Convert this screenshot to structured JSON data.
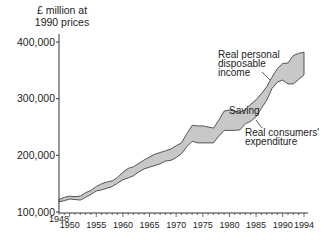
{
  "chart_data": {
    "type": "area",
    "title": "",
    "ylabel": "£ million at 1990 prices",
    "xlabel": "",
    "ylim": [
      100000,
      400000
    ],
    "yticks": [
      100000,
      200000,
      300000,
      400000
    ],
    "ytick_labels": [
      "100,000",
      "200,000",
      "300,000",
      "400,000"
    ],
    "xticks_labels": [
      "1948",
      "1950",
      "1955",
      "1960",
      "1965",
      "1970",
      "1975",
      "1980",
      "1985",
      "1990",
      "1994"
    ],
    "xlim": [
      1948,
      1994
    ],
    "grid": false,
    "x": [
      1948,
      1949,
      1950,
      1951,
      1952,
      1953,
      1954,
      1955,
      1956,
      1957,
      1958,
      1959,
      1960,
      1961,
      1962,
      1963,
      1964,
      1965,
      1966,
      1967,
      1968,
      1969,
      1970,
      1971,
      1972,
      1973,
      1974,
      1975,
      1976,
      1977,
      1978,
      1979,
      1980,
      1981,
      1982,
      1983,
      1984,
      1985,
      1986,
      1987,
      1988,
      1989,
      1990,
      1991,
      1992,
      1993,
      1994
    ],
    "series": [
      {
        "name": "Real personal disposable income",
        "values": [
          122000,
          126000,
          128000,
          127000,
          128000,
          134000,
          138000,
          145000,
          150000,
          153000,
          155000,
          161000,
          170000,
          177000,
          180000,
          186000,
          192000,
          197000,
          202000,
          205000,
          208000,
          211000,
          217000,
          222000,
          238000,
          253000,
          252000,
          252000,
          250000,
          248000,
          262000,
          278000,
          280000,
          278000,
          276000,
          281000,
          290000,
          298000,
          309000,
          321000,
          338000,
          353000,
          362000,
          363000,
          376000,
          380000,
          382000
        ]
      },
      {
        "name": "Real consumers' expenditure",
        "values": [
          118000,
          120000,
          123000,
          122000,
          121000,
          126000,
          131000,
          137000,
          139000,
          142000,
          145000,
          151000,
          157000,
          160000,
          164000,
          171000,
          176000,
          179000,
          182000,
          185000,
          190000,
          191000,
          196000,
          203000,
          215000,
          225000,
          222000,
          222000,
          222000,
          222000,
          234000,
          244000,
          244000,
          244000,
          245000,
          256000,
          260000,
          268000,
          283000,
          297000,
          318000,
          329000,
          333000,
          326000,
          326000,
          334000,
          342000
        ]
      }
    ],
    "annotations": [
      {
        "text": "Real personal disposable income",
        "target_year": 1983
      },
      {
        "text": "Saving",
        "target_year": 1981
      },
      {
        "text": "Real consumers' expenditure",
        "target_year": 1983
      }
    ],
    "fill_between": {
      "color": "#c8c8c8",
      "label": "Saving"
    }
  },
  "labels": {
    "ylabel_line1": "£ million at",
    "ylabel_line2": "1990 prices",
    "income_l1": "Real personal",
    "income_l2": "disposable",
    "income_l3": "income",
    "saving": "Saving",
    "expend_l1": "Real consumers'",
    "expend_l2": "expenditure"
  },
  "colors": {
    "fill": "#c8c8c8",
    "line": "#444444",
    "axis": "#333333"
  }
}
